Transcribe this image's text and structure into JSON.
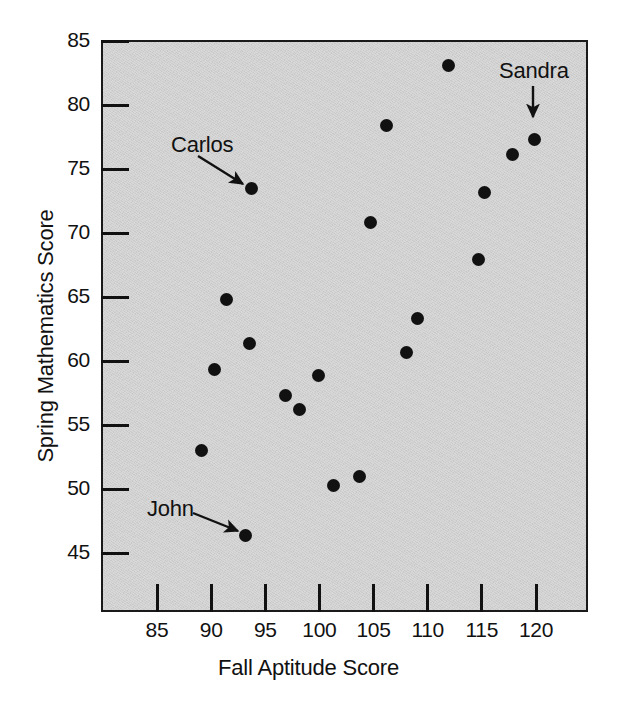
{
  "chart_data": {
    "type": "scatter",
    "title": "",
    "xlabel": "Fall Aptitude Score",
    "ylabel": "Spring Mathematics Score",
    "xlim": [
      81.4,
      126.4
    ],
    "ylim": [
      41.3,
      85.0
    ],
    "xticks": [
      85,
      90,
      95,
      100,
      105,
      110,
      115,
      120
    ],
    "yticks": [
      45,
      50,
      55,
      60,
      65,
      70,
      75,
      80,
      85
    ],
    "xtick_labels": [
      "85",
      "90",
      "95",
      "100",
      "105",
      "110",
      "115",
      "120"
    ],
    "ytick_labels": [
      "45",
      "50",
      "55",
      "60",
      "65",
      "70",
      "75",
      "80",
      "85"
    ],
    "grid": false,
    "legend": "none",
    "marker": "filled-circle",
    "marker_color": "#111111",
    "plot_background": "#cfcfcf",
    "points": [
      {
        "x": 89.1,
        "y": 53.0,
        "label": ""
      },
      {
        "x": 90.3,
        "y": 59.3,
        "label": ""
      },
      {
        "x": 91.4,
        "y": 64.8,
        "label": ""
      },
      {
        "x": 93.2,
        "y": 46.4,
        "label": "John"
      },
      {
        "x": 93.5,
        "y": 61.4,
        "label": ""
      },
      {
        "x": 93.7,
        "y": 73.5,
        "label": "Carlos"
      },
      {
        "x": 96.9,
        "y": 57.3,
        "label": ""
      },
      {
        "x": 98.2,
        "y": 56.2,
        "label": ""
      },
      {
        "x": 99.9,
        "y": 58.9,
        "label": ""
      },
      {
        "x": 101.3,
        "y": 50.3,
        "label": ""
      },
      {
        "x": 103.7,
        "y": 51.0,
        "label": ""
      },
      {
        "x": 104.7,
        "y": 70.8,
        "label": ""
      },
      {
        "x": 106.2,
        "y": 78.4,
        "label": ""
      },
      {
        "x": 108.0,
        "y": 60.7,
        "label": ""
      },
      {
        "x": 109.1,
        "y": 63.3,
        "label": ""
      },
      {
        "x": 111.9,
        "y": 83.1,
        "label": ""
      },
      {
        "x": 114.7,
        "y": 67.9,
        "label": ""
      },
      {
        "x": 115.2,
        "y": 73.2,
        "label": ""
      },
      {
        "x": 117.8,
        "y": 76.1,
        "label": ""
      },
      {
        "x": 119.9,
        "y": 77.3,
        "label": "Sandra"
      }
    ],
    "annotations": [
      {
        "text": "Carlos",
        "label_x": 171,
        "label_y": 145,
        "arrow": "diagonal-down-right"
      },
      {
        "text": "John",
        "label_x": 147,
        "label_y": 509,
        "arrow": "diagonal-down-right"
      },
      {
        "text": "Sandra",
        "label_x": 499,
        "label_y": 71,
        "arrow": "straight-down"
      }
    ]
  }
}
